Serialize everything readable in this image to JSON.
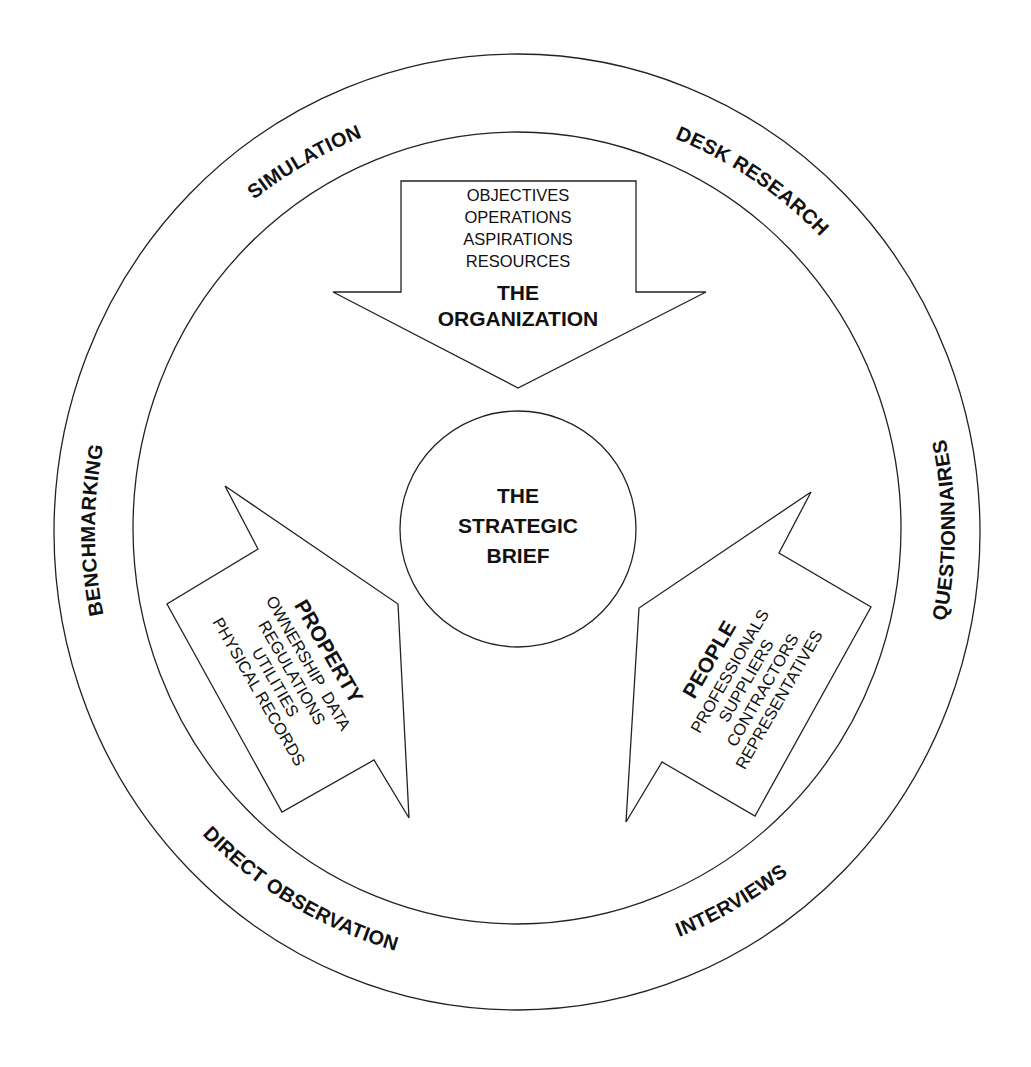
{
  "diagram": {
    "center": {
      "lines": [
        "THE",
        "STRATEGIC",
        "BRIEF"
      ]
    },
    "arrows": {
      "organization": {
        "title_lines": [
          "THE",
          "ORGANIZATION"
        ],
        "items": [
          "OBJECTIVES",
          "OPERATIONS",
          "ASPIRATIONS",
          "RESOURCES"
        ]
      },
      "property": {
        "title": "PROPERTY",
        "items": [
          "OWNERSHIP  DATA",
          "REGULATIONS",
          "UTILITIES",
          "PHYSICAL RECORDS"
        ]
      },
      "people": {
        "title": "PEOPLE",
        "items": [
          "PROFESSIONALS",
          "SUPPLIERS",
          "CONTRACTORS",
          "REPRESENTATIVES"
        ]
      }
    },
    "ring_methods": {
      "simulation": "SIMULATION",
      "desk_research": "DESK RESEARCH",
      "benchmarking": "BENCHMARKING",
      "questionnaires": "QUESTIONNAIRES",
      "direct_observation": "DIRECT OBSERVATION",
      "interviews": "INTERVIEWS"
    },
    "colors": {
      "stroke": "#222222",
      "text": "#111111",
      "background": "#ffffff"
    }
  }
}
